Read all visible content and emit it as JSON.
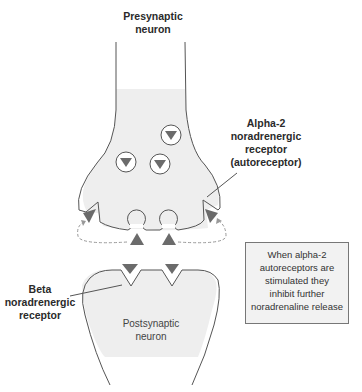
{
  "labels": {
    "presynaptic": [
      "Presynaptic",
      "neuron"
    ],
    "alpha2": [
      "Alpha-2",
      "noradrenergic",
      "receptor",
      "(autoreceptor)"
    ],
    "beta": [
      "Beta",
      "noradrenergic",
      "receptor"
    ],
    "postsynaptic": [
      "Postsynaptic",
      "neuron"
    ]
  },
  "note": {
    "lines": [
      "When alpha-2",
      "autoreceptors are",
      "stimulated they",
      "inhibit further",
      "noradrenaline release"
    ]
  },
  "colors": {
    "neuron_fill": "#eeeeee",
    "outline": "#555555",
    "triangle": "#6b6b6b",
    "dashed_arrow": "#999999"
  }
}
